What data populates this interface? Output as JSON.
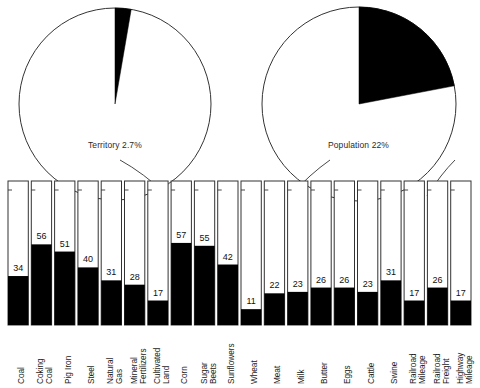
{
  "figure": {
    "title": "",
    "background_color": "#ffffff",
    "fill_color": "#000000",
    "outline_color": "#333333"
  },
  "pies": [
    {
      "name": "territory",
      "label": "Territory 2.7%",
      "percent": 2.7,
      "cx": 115,
      "cy": 104,
      "r": 96,
      "label_x": 88,
      "label_y": 140
    },
    {
      "name": "population",
      "label": "Population 22%",
      "percent": 22,
      "cx": 359,
      "cy": 104,
      "r": 97,
      "label_x": 328,
      "label_y": 140
    }
  ],
  "chart_data": {
    "type": "bar",
    "title": "",
    "subtitle": "",
    "xlabel": "",
    "ylabel": "",
    "ylim": [
      0,
      100
    ],
    "grid": false,
    "legend": null,
    "note": "Each bar is a full-height outlined box representing 100%; the black filled portion from the bottom is the labeled percentage.",
    "categories": [
      "Coal",
      "Coking Coal",
      "Pig Iron",
      "Steel",
      "Natural Gas",
      "Mineral Fertilizers",
      "Cultivated Land",
      "Corn",
      "Sugar Beets",
      "Sunflowers",
      "Wheat",
      "Meat",
      "Milk",
      "Butter",
      "Eggs",
      "Cattle",
      "Swine",
      "Railroad Mileage",
      "Railroad Freight",
      "Highway Mileage"
    ],
    "category_lines": [
      [
        "Coal"
      ],
      [
        "Coking",
        "Coal"
      ],
      [
        "Pig Iron"
      ],
      [
        "Steel"
      ],
      [
        "Natural",
        "Gas"
      ],
      [
        "Mineral",
        "Fertilizers"
      ],
      [
        "Cultivated",
        "Land"
      ],
      [
        "Corn"
      ],
      [
        "Sugar",
        "Beets"
      ],
      [
        "Sunflowers"
      ],
      [
        "Wheat"
      ],
      [
        "Meat"
      ],
      [
        "Milk"
      ],
      [
        "Butter"
      ],
      [
        "Eggs"
      ],
      [
        "Cattle"
      ],
      [
        "Swine"
      ],
      [
        "Railroad",
        "Mileage"
      ],
      [
        "Railroad",
        "Freight"
      ],
      [
        "Highway",
        "Mileage"
      ]
    ],
    "values": [
      34,
      56,
      51,
      40,
      31,
      28,
      17,
      57,
      55,
      42,
      11,
      22,
      23,
      26,
      26,
      23,
      31,
      17,
      26,
      17
    ]
  },
  "leaders": [
    {
      "name": "territory-leader",
      "from_x": 167,
      "from_y": 195,
      "to_x": 120,
      "to_y": 160
    },
    {
      "name": "population-leader",
      "from_x": 290,
      "from_y": 196,
      "to_x": 330,
      "to_y": 160
    },
    {
      "name": "population-leader-2",
      "from_x": 427,
      "from_y": 196,
      "to_x": 455,
      "to_y": 160
    }
  ]
}
